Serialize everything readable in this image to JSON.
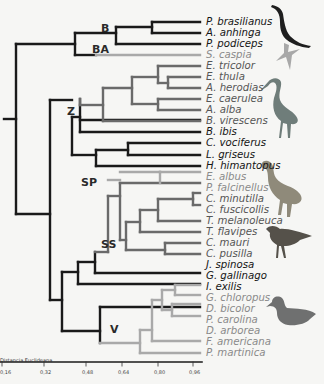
{
  "figure": {
    "type": "dendrogram",
    "axis": {
      "title": "Distancia Euclideana",
      "ticks": [
        "0,16",
        "0,32",
        "0,48",
        "0,64",
        "0,80",
        "0,96"
      ]
    },
    "groups": [
      {
        "label": "B"
      },
      {
        "label": "BA"
      },
      {
        "label": "Z"
      },
      {
        "label": "SP"
      },
      {
        "label": "SS"
      },
      {
        "label": "V"
      }
    ],
    "leaves": [
      {
        "label": "P. brasilianus",
        "tone": "dark"
      },
      {
        "label": "A. anhinga",
        "tone": "dark"
      },
      {
        "label": "P. podiceps",
        "tone": "dark"
      },
      {
        "label": "S. caspia",
        "tone": "light"
      },
      {
        "label": "E. tricolor",
        "tone": "mid"
      },
      {
        "label": "E. thula",
        "tone": "mid"
      },
      {
        "label": "A. herodias",
        "tone": "mid"
      },
      {
        "label": "E. caerulea",
        "tone": "mid"
      },
      {
        "label": "A. alba",
        "tone": "mid"
      },
      {
        "label": "B. virescens",
        "tone": "mid"
      },
      {
        "label": "B. ibis",
        "tone": "dark"
      },
      {
        "label": "C. vociferus",
        "tone": "dark"
      },
      {
        "label": "L. griseus",
        "tone": "dark"
      },
      {
        "label": "H. himantopus",
        "tone": "dark"
      },
      {
        "label": "E. albus",
        "tone": "light"
      },
      {
        "label": "P. falcinellus",
        "tone": "light"
      },
      {
        "label": "C. minutilla",
        "tone": "mid"
      },
      {
        "label": "C. fuscicollis",
        "tone": "mid"
      },
      {
        "label": "T. melanoleuca",
        "tone": "mid"
      },
      {
        "label": "T. flavipes",
        "tone": "mid"
      },
      {
        "label": "C. mauri",
        "tone": "mid"
      },
      {
        "label": "C. pusilla",
        "tone": "mid"
      },
      {
        "label": "J. spinosa",
        "tone": "dark"
      },
      {
        "label": "G. gallinago",
        "tone": "dark"
      },
      {
        "label": "I. exilis",
        "tone": "dark"
      },
      {
        "label": "G. chloropus",
        "tone": "light"
      },
      {
        "label": "D. bicolor",
        "tone": "light"
      },
      {
        "label": "P. carolina",
        "tone": "light"
      },
      {
        "label": "D. arborea",
        "tone": "light"
      },
      {
        "label": "F. americana",
        "tone": "light"
      },
      {
        "label": "P. martinica",
        "tone": "light"
      }
    ],
    "silhouettes": [
      "anhinga-silhouette",
      "tern-silhouette",
      "heron-silhouette",
      "ibis-silhouette",
      "plover-silhouette",
      "duck-silhouette"
    ],
    "colors": {
      "dark_branch": "#1a1a1a",
      "mid_branch": "#6a6a6a",
      "light_branch": "#a9a9a9",
      "silhouette_dark": "#1e1e1e",
      "silhouette_light": "#a8a8a8",
      "silhouette_heron": "#6f7d7a",
      "silhouette_ibis": "#8f8a7a",
      "silhouette_plover": "#55514a",
      "silhouette_duck": "#6f7070"
    }
  }
}
